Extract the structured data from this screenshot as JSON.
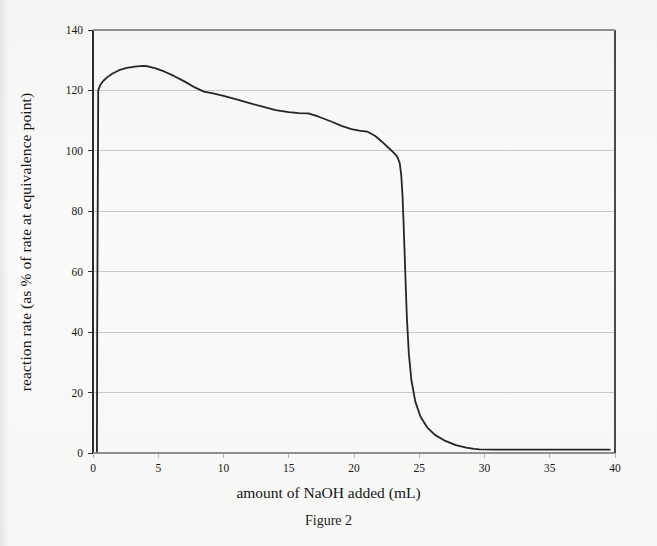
{
  "figure": {
    "caption": "Figure 2"
  },
  "chart_data": {
    "type": "line",
    "title": "",
    "subtitle": "",
    "xlabel": "amount of NaOH added (mL)",
    "ylabel": "reaction rate (as % of rate at equivalence point)",
    "xlim": [
      0,
      40
    ],
    "ylim": [
      0,
      140
    ],
    "xticks": [
      0,
      5,
      10,
      15,
      20,
      25,
      30,
      35,
      40
    ],
    "yticks": [
      0,
      20,
      40,
      60,
      80,
      100,
      120,
      140
    ],
    "xtick_labels": [
      "0",
      "5",
      "10",
      "15",
      "20",
      "25",
      "30",
      "35",
      "40"
    ],
    "ytick_labels": [
      "0",
      "20",
      "40",
      "60",
      "80",
      "100",
      "120",
      "140"
    ],
    "grid": "horizontal",
    "grid_color": "#c9c9c9",
    "axis_color": "#2b2b2b",
    "line_color": "#262626",
    "line_width": 1.8,
    "legend": null,
    "legend_position": "none",
    "annotations": [],
    "series": [
      {
        "name": "reaction rate",
        "x": [
          0.3,
          0.32,
          0.4,
          0.55,
          0.8,
          1.1,
          1.5,
          2.0,
          2.6,
          3.2,
          3.8,
          4.2,
          4.8,
          5.5,
          6.2,
          7.0,
          7.8,
          8.5,
          9.2,
          10.0,
          11.0,
          12.0,
          13.0,
          14.0,
          15.0,
          15.8,
          16.5,
          17.3,
          18.2,
          19.1,
          19.8,
          20.4,
          21.0,
          21.6,
          22.1,
          22.6,
          23.0,
          23.3,
          23.5,
          23.62,
          23.72,
          23.8,
          23.88,
          23.95,
          24.05,
          24.2,
          24.4,
          24.7,
          25.1,
          25.6,
          26.2,
          27.0,
          27.8,
          28.6,
          29.2,
          29.6,
          31.0,
          34.0,
          37.0,
          39.6
        ],
        "y": [
          0.5,
          40.0,
          120.0,
          121.8,
          123.2,
          124.4,
          125.6,
          126.7,
          127.5,
          127.9,
          128.1,
          128.0,
          127.3,
          126.2,
          124.8,
          123.0,
          121.0,
          119.6,
          119.0,
          118.2,
          117.0,
          115.8,
          114.6,
          113.5,
          112.8,
          112.5,
          112.4,
          111.3,
          109.8,
          108.2,
          107.2,
          106.7,
          106.4,
          105.0,
          103.2,
          101.2,
          99.6,
          98.2,
          96.0,
          92.0,
          85.0,
          76.0,
          66.0,
          57.0,
          45.0,
          33.0,
          24.0,
          17.0,
          12.0,
          8.5,
          6.0,
          4.0,
          2.6,
          1.8,
          1.4,
          1.2,
          1.1,
          1.1,
          1.1,
          1.1
        ]
      }
    ]
  }
}
